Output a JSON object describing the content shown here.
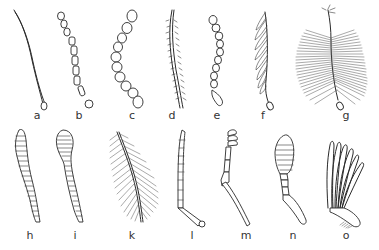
{
  "figure": {
    "labels": [
      {
        "id": "a",
        "text": "a",
        "x": 37,
        "y": 110
      },
      {
        "id": "b",
        "text": "b",
        "x": 79,
        "y": 110
      },
      {
        "id": "c",
        "text": "c",
        "x": 132,
        "y": 110
      },
      {
        "id": "d",
        "text": "d",
        "x": 172,
        "y": 110
      },
      {
        "id": "e",
        "text": "e",
        "x": 217,
        "y": 110
      },
      {
        "id": "f",
        "text": "f",
        "x": 263,
        "y": 110
      },
      {
        "id": "g",
        "text": "g",
        "x": 346,
        "y": 110
      },
      {
        "id": "h",
        "text": "h",
        "x": 30,
        "y": 230
      },
      {
        "id": "i",
        "text": "i",
        "x": 75,
        "y": 230
      },
      {
        "id": "k",
        "text": "k",
        "x": 132,
        "y": 230
      },
      {
        "id": "l",
        "text": "l",
        "x": 192,
        "y": 230
      },
      {
        "id": "m",
        "text": "m",
        "x": 246,
        "y": 230
      },
      {
        "id": "n",
        "text": "n",
        "x": 293,
        "y": 230
      },
      {
        "id": "o",
        "text": "o",
        "x": 346,
        "y": 230
      }
    ],
    "colors": {
      "ink": "#2a2a2a",
      "background": "#ffffff"
    }
  }
}
